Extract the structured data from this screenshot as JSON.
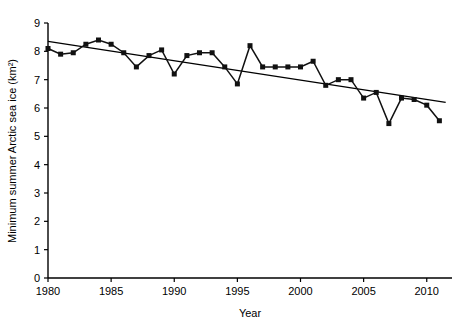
{
  "chart_data": {
    "type": "line",
    "title": "",
    "xlabel": "Year",
    "ylabel": "Minimum summer Arctic sea ice (km²)",
    "xlim": [
      1980,
      2012
    ],
    "ylim": [
      0,
      9
    ],
    "xticks": [
      1980,
      1985,
      1990,
      1995,
      2000,
      2005,
      2010
    ],
    "xtick_labels": [
      "1980",
      "1985",
      "1990",
      "1995",
      "2000",
      "2005",
      "2010"
    ],
    "yticks": [
      0,
      1,
      2,
      3,
      4,
      5,
      6,
      7,
      8,
      9
    ],
    "ytick_labels": [
      "0",
      "1",
      "2",
      "3",
      "4",
      "5",
      "6",
      "7",
      "8",
      "9"
    ],
    "grid": false,
    "legend": null,
    "marker": "square",
    "series": [
      {
        "name": "Minimum summer Arctic sea ice",
        "x": [
          1980,
          1981,
          1982,
          1983,
          1984,
          1985,
          1986,
          1987,
          1988,
          1989,
          1990,
          1991,
          1992,
          1993,
          1994,
          1995,
          1996,
          1997,
          1998,
          1999,
          2000,
          2001,
          2002,
          2003,
          2004,
          2005,
          2006,
          2007,
          2008,
          2009,
          2010,
          2011
        ],
        "values": [
          8.1,
          7.9,
          7.95,
          8.25,
          8.4,
          8.25,
          7.95,
          7.45,
          7.85,
          8.05,
          7.2,
          7.85,
          7.95,
          7.95,
          7.45,
          6.85,
          8.2,
          7.45,
          7.45,
          7.45,
          7.45,
          7.65,
          6.8,
          7.0,
          7.0,
          6.35,
          6.55,
          5.45,
          6.35,
          6.3,
          6.1,
          5.55
        ]
      }
    ],
    "trend_line": {
      "name": "linear trend",
      "x": [
        1980,
        2011.5
      ],
      "values": [
        8.35,
        6.2
      ]
    }
  }
}
